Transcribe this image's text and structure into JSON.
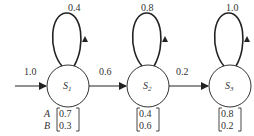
{
  "diagram": {
    "type": "hidden-markov-model",
    "colors": {
      "stroke": "#222222",
      "text": "#333333",
      "background": "#ffffff"
    },
    "initial_transition": {
      "label": "1.0",
      "to": "S1"
    },
    "states": [
      {
        "id": "S1",
        "name": "S",
        "subscript": "1",
        "self_loop": "0.4",
        "emission": [
          "0.7",
          "0.3"
        ]
      },
      {
        "id": "S2",
        "name": "S",
        "subscript": "2",
        "self_loop": "0.8",
        "emission": [
          "0.4",
          "0.6"
        ]
      },
      {
        "id": "S3",
        "name": "S",
        "subscript": "3",
        "self_loop": "1.0",
        "emission": [
          "0.8",
          "0.2"
        ]
      }
    ],
    "transitions": [
      {
        "from": "S1",
        "to": "S2",
        "label": "0.6"
      },
      {
        "from": "S2",
        "to": "S3",
        "label": "0.2"
      }
    ],
    "emission_symbols": [
      "A",
      "B"
    ]
  }
}
